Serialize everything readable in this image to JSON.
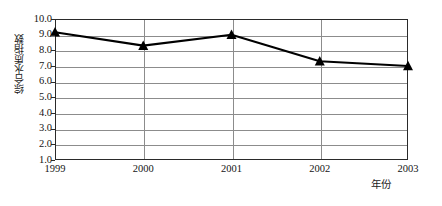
{
  "chart_data": {
    "type": "line",
    "title": "",
    "xlabel": "年份",
    "ylabel": "综合水质指数",
    "categories": [
      "1999",
      "2000",
      "2001",
      "2002",
      "2003"
    ],
    "values": [
      9.15,
      8.3,
      9.0,
      7.3,
      7.0
    ],
    "series": [
      {
        "name": "综合水质指数",
        "values": [
          9.15,
          8.3,
          9.0,
          7.3,
          7.0
        ],
        "marker": "triangle-up",
        "marker_color": "#000000",
        "line_color": "#000000"
      }
    ],
    "ylim": [
      1.0,
      10.0
    ],
    "ytick_step": 1.0,
    "ytick_labels": [
      "10.0",
      "9.0",
      "8.0",
      "7.0",
      "6.0",
      "5.0",
      "4.0",
      "3.0",
      "2.0",
      "1.0"
    ],
    "ytick_values": [
      10.0,
      9.0,
      8.0,
      7.0,
      6.0,
      5.0,
      4.0,
      3.0,
      2.0,
      1.0
    ],
    "xtick_labels": [
      "1999",
      "2000",
      "2001",
      "2002",
      "2003"
    ],
    "grid": {
      "horizontal": true,
      "vertical": true,
      "color": "#8c8c8c"
    },
    "legend": null,
    "legend_position": "none",
    "annotations": []
  },
  "axes": {
    "ylabel_text": "综合水质指数",
    "xlabel_text": "年份"
  }
}
